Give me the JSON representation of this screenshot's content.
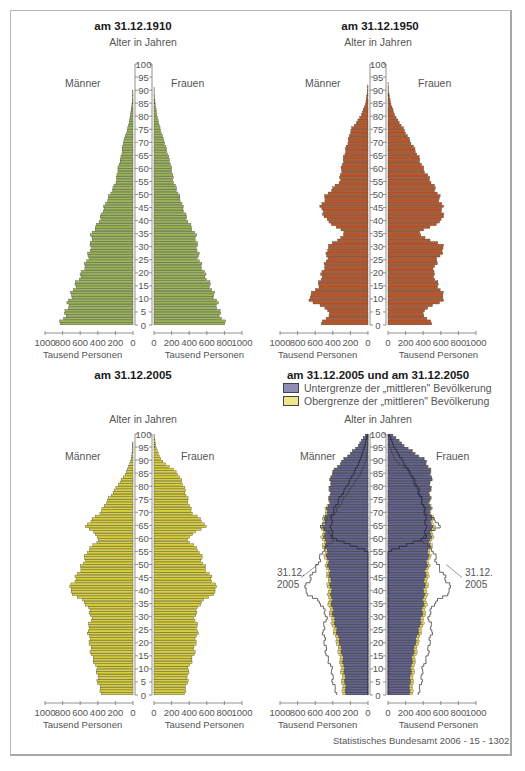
{
  "frame": {
    "border_color": "#b8b8b8"
  },
  "labels": {
    "age_axis": "Alter in Jahren",
    "men": "Männer",
    "women": "Frauen",
    "x_unit": "Tausend Personen",
    "x_ticks_left": "1000 800 600 400 200 0",
    "x_ticks_right": "0 200 400 600 800 1000",
    "source": "Statistisches Bundesamt 2006 - 15 - 1302",
    "annotation_2005": "31.12.\n2005"
  },
  "legend": [
    {
      "label": "Untergrenze der „mittleren\" Bevölkerung",
      "color": "#62628f"
    },
    {
      "label": "Obergrenze der „mittleren\" Bevölkerung",
      "color": "#e8d870"
    }
  ],
  "chart_data": [
    {
      "type": "bar",
      "title": "am 31.12.1910",
      "ylabel": "Alter in Jahren",
      "xlabel": "Tausend Personen",
      "orientation": "horizontal-pyramid",
      "y_ticks": [
        0,
        5,
        10,
        15,
        20,
        25,
        30,
        35,
        40,
        45,
        50,
        55,
        60,
        65,
        70,
        75,
        80,
        85,
        90,
        95,
        100
      ],
      "xlim": [
        0,
        1000
      ],
      "color": "#9bb55a",
      "ages": [
        0,
        5,
        10,
        15,
        20,
        25,
        30,
        35,
        40,
        45,
        50,
        55,
        60,
        65,
        70,
        75,
        80,
        85,
        90,
        95,
        100
      ],
      "series": [
        {
          "name": "Männer",
          "values": [
            830,
            760,
            720,
            660,
            580,
            520,
            480,
            470,
            380,
            330,
            260,
            190,
            170,
            130,
            110,
            60,
            30,
            10,
            2,
            0,
            0
          ]
        },
        {
          "name": "Frauen",
          "values": [
            810,
            740,
            700,
            640,
            570,
            510,
            490,
            470,
            380,
            330,
            280,
            220,
            200,
            160,
            120,
            70,
            35,
            12,
            3,
            0,
            0
          ]
        }
      ]
    },
    {
      "type": "bar",
      "title": "am 31.12.1950",
      "ylabel": "Alter in Jahren",
      "xlabel": "Tausend Personen",
      "orientation": "horizontal-pyramid",
      "y_ticks": [
        0,
        5,
        10,
        15,
        20,
        25,
        30,
        35,
        40,
        45,
        50,
        55,
        60,
        65,
        70,
        75,
        80,
        85,
        90,
        95,
        100
      ],
      "xlim": [
        0,
        1000
      ],
      "color": "#c0552a",
      "ages": [
        0,
        5,
        10,
        15,
        20,
        25,
        30,
        35,
        40,
        45,
        50,
        55,
        60,
        65,
        70,
        75,
        80,
        85,
        90,
        95,
        100
      ],
      "series": [
        {
          "name": "Männer",
          "values": [
            540,
            420,
            690,
            560,
            520,
            470,
            460,
            250,
            470,
            540,
            470,
            320,
            300,
            270,
            230,
            190,
            80,
            25,
            4,
            0,
            0
          ]
        },
        {
          "name": "Frauen",
          "values": [
            510,
            380,
            650,
            570,
            510,
            560,
            650,
            330,
            620,
            620,
            570,
            490,
            400,
            340,
            260,
            180,
            80,
            30,
            5,
            0,
            0
          ]
        }
      ]
    },
    {
      "type": "bar",
      "title": "am 31.12.2005",
      "ylabel": "Alter in Jahren",
      "xlabel": "Tausend Personen",
      "orientation": "horizontal-pyramid",
      "y_ticks": [
        0,
        5,
        10,
        15,
        20,
        25,
        30,
        35,
        40,
        45,
        50,
        55,
        60,
        65,
        70,
        75,
        80,
        85,
        90,
        95,
        100
      ],
      "xlim": [
        0,
        1000
      ],
      "color": "#d9cf3a",
      "ages": [
        0,
        5,
        10,
        15,
        20,
        25,
        30,
        35,
        40,
        45,
        50,
        55,
        60,
        65,
        70,
        75,
        80,
        85,
        90,
        95,
        100
      ],
      "series": [
        {
          "name": "Männer",
          "values": [
            350,
            400,
            410,
            470,
            490,
            510,
            470,
            530,
            730,
            650,
            570,
            520,
            380,
            540,
            370,
            280,
            180,
            80,
            20,
            4,
            0
          ]
        },
        {
          "name": "Frauen",
          "values": [
            340,
            380,
            390,
            450,
            470,
            500,
            460,
            520,
            720,
            650,
            560,
            520,
            370,
            600,
            430,
            380,
            340,
            270,
            80,
            20,
            2
          ]
        }
      ]
    },
    {
      "type": "bar",
      "title": "am 31.12.2005 und am 31.12.2050",
      "ylabel": "Alter in Jahren",
      "xlabel": "Tausend Personen",
      "orientation": "horizontal-pyramid",
      "y_ticks": [
        0,
        5,
        10,
        15,
        20,
        25,
        30,
        35,
        40,
        45,
        50,
        55,
        60,
        65,
        70,
        75,
        80,
        85,
        90,
        95,
        100
      ],
      "xlim": [
        0,
        1000
      ],
      "ages": [
        0,
        5,
        10,
        15,
        20,
        25,
        30,
        35,
        40,
        45,
        50,
        55,
        60,
        65,
        70,
        75,
        80,
        85,
        90,
        95,
        100
      ],
      "series": [
        {
          "name": "Männer 2050 Untergrenze",
          "color": "#62628f",
          "values": [
            250,
            260,
            270,
            290,
            320,
            360,
            390,
            410,
            420,
            430,
            450,
            470,
            490,
            500,
            470,
            430,
            430,
            410,
            280,
            120,
            20
          ]
        },
        {
          "name": "Männer 2050 Obergrenze",
          "color": "#e8d870",
          "values": [
            285,
            295,
            305,
            325,
            355,
            395,
            425,
            445,
            455,
            460,
            475,
            495,
            520,
            525,
            490,
            440,
            435,
            415,
            285,
            125,
            22
          ]
        },
        {
          "name": "Frauen 2050 Untergrenze",
          "color": "#62628f",
          "values": [
            240,
            250,
            260,
            280,
            310,
            350,
            380,
            400,
            410,
            420,
            440,
            460,
            480,
            500,
            480,
            470,
            480,
            490,
            420,
            200,
            40
          ]
        },
        {
          "name": "Frauen 2050 Obergrenze",
          "color": "#e8d870",
          "values": [
            275,
            285,
            295,
            315,
            345,
            385,
            415,
            435,
            445,
            455,
            465,
            485,
            505,
            525,
            495,
            480,
            485,
            495,
            425,
            205,
            42
          ]
        },
        {
          "name": "Männer 2005 (Umriss)",
          "values": [
            350,
            400,
            410,
            470,
            490,
            510,
            470,
            530,
            730,
            650,
            570,
            520,
            380,
            540,
            370,
            280,
            180,
            80,
            20,
            4,
            0
          ]
        },
        {
          "name": "Frauen 2005 (Umriss)",
          "values": [
            340,
            380,
            390,
            450,
            470,
            500,
            460,
            520,
            720,
            650,
            560,
            520,
            370,
            600,
            430,
            380,
            340,
            270,
            80,
            20,
            2
          ]
        }
      ],
      "annotations": [
        "31.12. 2005 (links)",
        "31.12. 2005 (rechts)"
      ]
    }
  ]
}
